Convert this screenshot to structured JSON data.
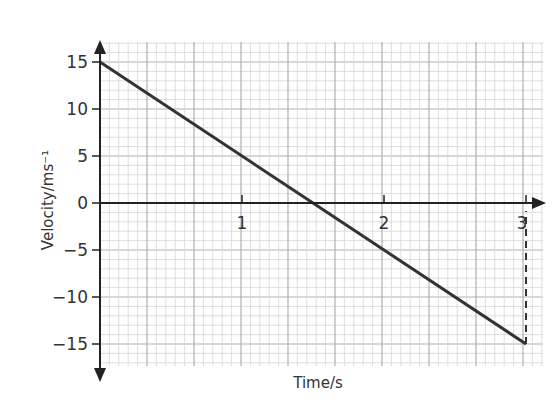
{
  "chart_data": {
    "type": "line",
    "title": "",
    "xlabel": "Time/s",
    "ylabel": "Velocity/ms⁻¹",
    "xlim": [
      0,
      3.12
    ],
    "ylim": [
      -17,
      17
    ],
    "x_ticks": [
      "1",
      "2",
      "3"
    ],
    "y_ticks": [
      "15",
      "10",
      "5",
      "0",
      "−5",
      "−10",
      "−15"
    ],
    "grid": true,
    "series": [
      {
        "name": "velocity",
        "x": [
          0,
          1.5,
          3
        ],
        "y": [
          15,
          0,
          -15
        ]
      }
    ],
    "annotations": [
      {
        "type": "dashed-vertical-line",
        "x": 3,
        "from_y": -15,
        "to_y": 0
      }
    ],
    "colors": {
      "line": "#333333",
      "axis": "#222222",
      "grid_minor": "#d6d6d6",
      "grid_major": "#b0b0b0"
    }
  },
  "labels": {
    "x_axis_title": "Time/s",
    "y_axis_title": "Velocity/ms⁻¹",
    "x1": "1",
    "x2": "2",
    "x3": "3",
    "y15": "15",
    "y10": "10",
    "y5": "5",
    "y0": "0",
    "ym5": "−5",
    "ym10": "−10",
    "ym15": "−15"
  }
}
